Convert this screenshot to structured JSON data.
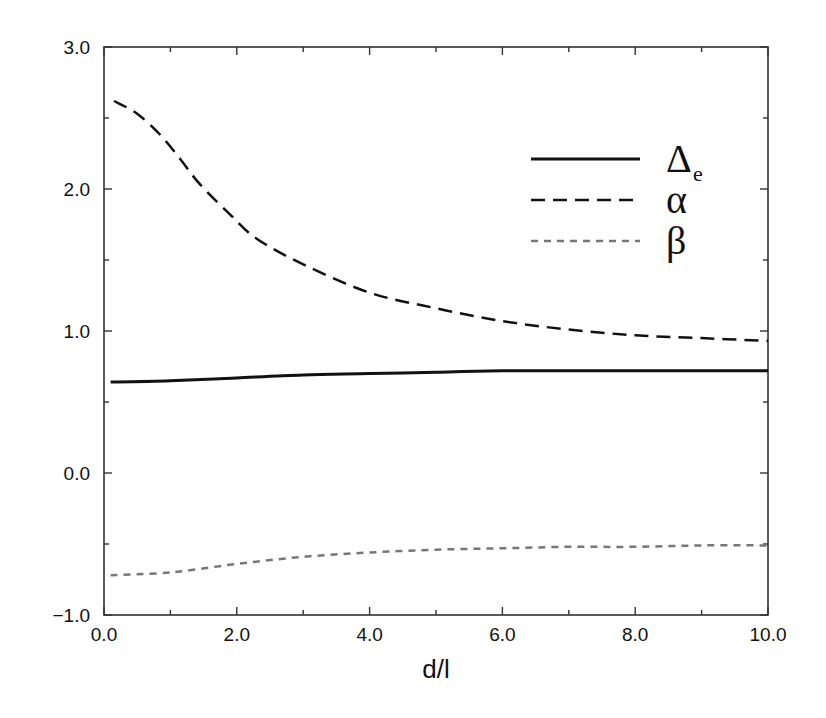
{
  "chart_data": {
    "type": "line",
    "title": "",
    "xlabel": "d/l",
    "ylabel": "",
    "xlim": [
      0.0,
      10.0
    ],
    "ylim": [
      -1.0,
      3.0
    ],
    "grid": false,
    "legend_position": "upper right",
    "x_ticks": [
      0,
      2,
      4,
      6,
      8,
      10
    ],
    "x_tick_labels": [
      "0.0",
      "2.0",
      "4.0",
      "6.0",
      "8.0",
      "10.0"
    ],
    "x_minor_ticks": [
      1,
      3,
      5,
      7,
      9
    ],
    "y_ticks": [
      -1,
      0,
      1,
      2,
      3
    ],
    "y_tick_labels": [
      "−1.0",
      "0.0",
      "1.0",
      "2.0",
      "3.0"
    ],
    "y_minor_ticks": [
      -0.5,
      0.5,
      1.5,
      2.5
    ],
    "series": [
      {
        "name": "Δe",
        "symbol": "Δ",
        "subscript": "e",
        "style": "solid",
        "color": "#111111",
        "width": 3,
        "x": [
          0.1,
          1.0,
          2.0,
          3.0,
          4.0,
          5.0,
          6.0,
          7.0,
          8.0,
          9.0,
          10.0
        ],
        "values": [
          0.64,
          0.65,
          0.67,
          0.69,
          0.7,
          0.71,
          0.72,
          0.72,
          0.72,
          0.72,
          0.72
        ]
      },
      {
        "name": "α",
        "symbol": "α",
        "subscript": "",
        "style": "long-dash",
        "color": "#111111",
        "width": 2.5,
        "x": [
          0.15,
          0.5,
          0.85,
          1.15,
          1.45,
          1.9,
          2.3,
          3.0,
          4.0,
          5.0,
          6.0,
          7.0,
          8.0,
          9.0,
          10.0
        ],
        "values": [
          2.62,
          2.53,
          2.38,
          2.21,
          2.03,
          1.82,
          1.65,
          1.47,
          1.27,
          1.16,
          1.07,
          1.01,
          0.97,
          0.95,
          0.93
        ]
      },
      {
        "name": "β",
        "symbol": "β",
        "subscript": "",
        "style": "short-dash",
        "color": "#777777",
        "width": 2.5,
        "x": [
          0.1,
          1.0,
          2.0,
          3.0,
          4.0,
          5.0,
          6.0,
          7.0,
          8.0,
          9.0,
          10.0
        ],
        "values": [
          -0.72,
          -0.7,
          -0.64,
          -0.59,
          -0.56,
          -0.54,
          -0.53,
          -0.52,
          -0.52,
          -0.51,
          -0.51
        ]
      }
    ]
  }
}
